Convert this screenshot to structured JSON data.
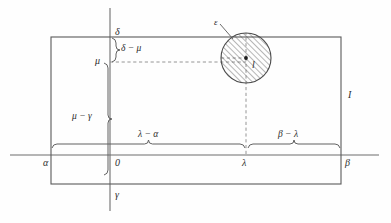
{
  "figure": {
    "background": "#fefefe",
    "line_color": "#5a5a5a",
    "dash_color": "#7a7a7a",
    "text_color": "#2b2b2b",
    "hatch_color": "#4a4a4a"
  },
  "axes": {
    "x_axis": {
      "name": "horizontal-axis",
      "y": 155,
      "x_start": 10,
      "x_end": 379
    },
    "y_axis": {
      "name": "vertical-axis",
      "x": 110,
      "y_start": 8,
      "y_end": 211
    }
  },
  "rectangle": {
    "name": "region-I",
    "left": 51,
    "top": 37,
    "right": 341,
    "bottom": 184,
    "label": "I",
    "label_x": 348,
    "label_y": 90
  },
  "disc": {
    "name": "hatched-disc",
    "cx": 246,
    "cy": 58,
    "r": 25,
    "center_label": "l",
    "center_label_x": 252,
    "center_label_y": 60,
    "radius_label": "ε",
    "radius_label_x": 214,
    "radius_label_y": 18,
    "hatched": true
  },
  "axis_labels": [
    {
      "name": "label-delta",
      "text": "δ",
      "x": 115,
      "y": 27
    },
    {
      "name": "label-mu",
      "text": "μ",
      "x": 95,
      "y": 56
    },
    {
      "name": "label-gamma",
      "text": "γ",
      "x": 115,
      "y": 190
    },
    {
      "name": "label-zero",
      "text": "0",
      "x": 115,
      "y": 158
    },
    {
      "name": "label-alpha",
      "text": "α",
      "x": 43,
      "y": 158
    },
    {
      "name": "label-beta",
      "text": "β",
      "x": 345,
      "y": 158
    },
    {
      "name": "label-lambda",
      "text": "λ",
      "x": 242,
      "y": 158
    }
  ],
  "braces": [
    {
      "name": "brace-delta-minus-mu",
      "orientation": "vertical",
      "x": 112,
      "y_top": 38,
      "y_bottom": 62,
      "label": "δ − μ",
      "label_x": 121,
      "label_y": 44
    },
    {
      "name": "brace-mu-minus-gamma",
      "orientation": "vertical",
      "x": 104,
      "y_top": 63,
      "y_bottom": 175,
      "label": "μ − γ",
      "label_x": 72,
      "label_y": 112
    },
    {
      "name": "brace-lambda-minus-alpha",
      "orientation": "horizontal",
      "y": 148,
      "x_left": 52,
      "x_right": 245,
      "label": "λ − α",
      "label_x": 138,
      "label_y": 130
    },
    {
      "name": "brace-beta-minus-lambda",
      "orientation": "horizontal",
      "y": 148,
      "x_left": 248,
      "x_right": 340,
      "label": "β − λ",
      "label_x": 278,
      "label_y": 130
    }
  ],
  "dashed_lines": [
    {
      "name": "dashed-horizontal-mu-to-center",
      "x1": 110,
      "y1": 62,
      "x2": 246,
      "y2": 62
    },
    {
      "name": "dashed-vertical-center-to-lambda",
      "x1": 246,
      "y1": 58,
      "x2": 246,
      "y2": 155
    },
    {
      "name": "dashed-vertical-center-up",
      "x1": 246,
      "y1": 58,
      "x2": 246,
      "y2": 33
    },
    {
      "name": "dashed-horizontal-center-left",
      "x1": 221,
      "y1": 58,
      "x2": 246,
      "y2": 58
    }
  ],
  "leader_line": {
    "name": "epsilon-leader",
    "x1": 220,
    "y1": 24,
    "x2": 233,
    "y2": 39
  }
}
